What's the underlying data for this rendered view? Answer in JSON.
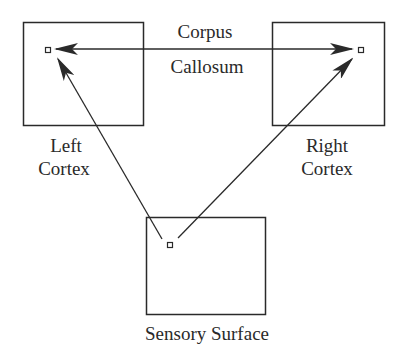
{
  "diagram": {
    "colors": {
      "stroke": "#2a2a2a",
      "background": "#ffffff"
    },
    "nodes": [
      {
        "id": "left_cortex",
        "label_lines": [
          "Left",
          "Cortex"
        ]
      },
      {
        "id": "right_cortex",
        "label_lines": [
          "Right",
          "Cortex"
        ]
      },
      {
        "id": "sensory_surface",
        "label_lines": [
          "Sensory Surface"
        ]
      }
    ],
    "edges": [
      {
        "from": "sensory_surface",
        "to": "left_cortex",
        "directed": true
      },
      {
        "from": "sensory_surface",
        "to": "right_cortex",
        "directed": true
      },
      {
        "from": "left_cortex",
        "to": "right_cortex",
        "directed": "both",
        "label_lines": [
          "Corpus",
          "Callosum"
        ]
      }
    ]
  }
}
